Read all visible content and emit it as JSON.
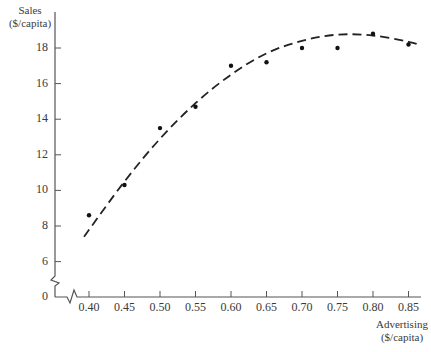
{
  "chart_data": {
    "type": "scatter",
    "title": "",
    "xlabel": "Advertising ($/capita)",
    "ylabel": "Sales ($/capita)",
    "xlabel_lines": [
      "Advertising",
      "($/capita)"
    ],
    "ylabel_lines": [
      "Sales",
      "($/capita)"
    ],
    "x_ticks": [
      0.4,
      0.45,
      0.5,
      0.55,
      0.6,
      0.65,
      0.7,
      0.75,
      0.8,
      0.85
    ],
    "x_tick_labels": [
      "0.40",
      "0.45",
      "0.50",
      "0.55",
      "0.60",
      "0.65",
      "0.70",
      "0.75",
      "0.80",
      "0.85"
    ],
    "y_ticks": [
      0,
      6,
      8,
      10,
      12,
      14,
      16,
      18
    ],
    "y_tick_labels": [
      "0",
      "6",
      "8",
      "10",
      "12",
      "14",
      "16",
      "18"
    ],
    "axis_breaks": {
      "x": true,
      "y": true
    },
    "grid": false,
    "legend": null,
    "series": [
      {
        "name": "Observed",
        "kind": "points",
        "x": [
          0.4,
          0.45,
          0.5,
          0.55,
          0.6,
          0.65,
          0.7,
          0.75,
          0.8,
          0.85
        ],
        "y": [
          8.6,
          10.3,
          13.5,
          14.7,
          17.0,
          17.2,
          18.0,
          18.0,
          18.8,
          18.2
        ]
      },
      {
        "name": "Fitted quadratic",
        "kind": "dashed-curve",
        "x": [
          0.393,
          0.45,
          0.5,
          0.55,
          0.6,
          0.65,
          0.7,
          0.75,
          0.8,
          0.85,
          0.867
        ],
        "y": [
          7.4,
          10.5,
          12.9,
          14.9,
          16.5,
          17.7,
          18.4,
          18.75,
          18.7,
          18.35,
          18.15
        ]
      }
    ]
  }
}
